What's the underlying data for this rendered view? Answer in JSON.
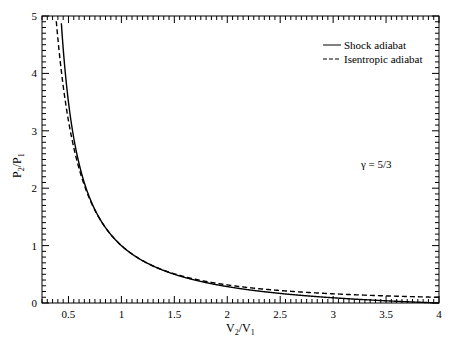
{
  "chart_data": {
    "type": "line",
    "title": "",
    "xlabel": "V2/V1",
    "ylabel": "P2/P1",
    "xlim": [
      0.25,
      4
    ],
    "ylim": [
      0,
      5
    ],
    "xticks": [
      0.5,
      1,
      1.5,
      2,
      2.5,
      3,
      3.5,
      4
    ],
    "xtick_labels": [
      "0.5",
      "1",
      "1.5",
      "2",
      "2.5",
      "3",
      "3.5",
      "4"
    ],
    "yticks": [
      0,
      1,
      2,
      3,
      4,
      5
    ],
    "ytick_labels": [
      "0",
      "1",
      "2",
      "3",
      "4",
      "5"
    ],
    "grid": false,
    "legend_position": "upper right",
    "annotation": "γ = 5/3",
    "series": [
      {
        "name": "Shock adiabat",
        "style": "solid",
        "x": [
          0.43,
          0.5,
          0.6,
          0.7,
          0.8,
          0.9,
          1.0,
          1.2,
          1.5,
          2.0,
          2.5,
          3.0,
          3.5,
          4.0
        ],
        "y": [
          4.96,
          3.5,
          2.46,
          1.83,
          1.41,
          1.18,
          1.0,
          0.74,
          0.5,
          0.29,
          0.17,
          0.09,
          0.04,
          0.0
        ]
      },
      {
        "name": "Isentropic adiabat",
        "style": "dashed",
        "x": [
          0.38,
          0.4,
          0.5,
          0.6,
          0.7,
          0.8,
          0.9,
          1.0,
          1.2,
          1.5,
          2.0,
          2.5,
          3.0,
          3.5,
          4.0
        ],
        "y": [
          5.0,
          4.6,
          3.17,
          2.34,
          1.81,
          1.45,
          1.19,
          1.0,
          0.74,
          0.51,
          0.31,
          0.22,
          0.16,
          0.12,
          0.1
        ]
      }
    ]
  },
  "labels": {
    "x_main": "V",
    "x_sub1": "2",
    "x_sep": "/V",
    "x_sub2": "1",
    "y_main": "P",
    "y_sub1": "2",
    "y_sep": "/P",
    "y_sub2": "1",
    "legend_shock": "Shock adiabat",
    "legend_isentropic": "Isentropic adiabat",
    "annotation": "γ = 5/3"
  }
}
